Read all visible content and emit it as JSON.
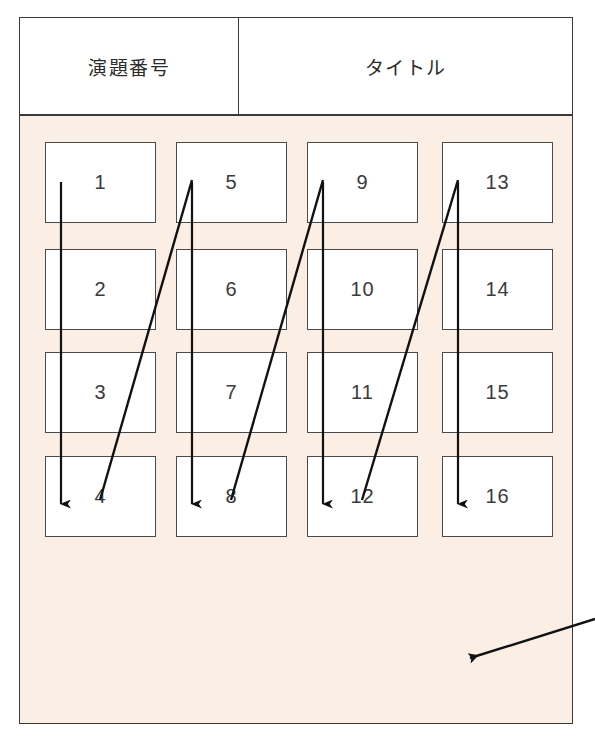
{
  "header": {
    "columns": [
      {
        "key": "number",
        "label": "演題番号"
      },
      {
        "key": "title",
        "label": "タイトル"
      }
    ]
  },
  "panel": {
    "background_color": "#faeee5",
    "border_color": "#3a3a3a"
  },
  "grid": {
    "rows": 4,
    "columns": 4,
    "order": "column-major",
    "cells": [
      {
        "label": "1",
        "col": 0,
        "row": 0,
        "x": 25,
        "y": 26
      },
      {
        "label": "2",
        "col": 0,
        "row": 1,
        "x": 25,
        "y": 133
      },
      {
        "label": "3",
        "col": 0,
        "row": 2,
        "x": 25,
        "y": 236
      },
      {
        "label": "4",
        "col": 0,
        "row": 3,
        "x": 25,
        "y": 340
      },
      {
        "label": "5",
        "col": 1,
        "row": 0,
        "x": 156,
        "y": 26
      },
      {
        "label": "6",
        "col": 1,
        "row": 1,
        "x": 156,
        "y": 133
      },
      {
        "label": "7",
        "col": 1,
        "row": 2,
        "x": 156,
        "y": 236
      },
      {
        "label": "8",
        "col": 1,
        "row": 3,
        "x": 156,
        "y": 340
      },
      {
        "label": "9",
        "col": 2,
        "row": 0,
        "x": 287,
        "y": 26
      },
      {
        "label": "10",
        "col": 2,
        "row": 1,
        "x": 287,
        "y": 133
      },
      {
        "label": "11",
        "col": 2,
        "row": 2,
        "x": 287,
        "y": 236
      },
      {
        "label": "12",
        "col": 2,
        "row": 3,
        "x": 287,
        "y": 340
      },
      {
        "label": "13",
        "col": 3,
        "row": 0,
        "x": 422,
        "y": 26
      },
      {
        "label": "14",
        "col": 3,
        "row": 1,
        "x": 422,
        "y": 133
      },
      {
        "label": "15",
        "col": 3,
        "row": 2,
        "x": 422,
        "y": 236
      },
      {
        "label": "16",
        "col": 3,
        "row": 3,
        "x": 422,
        "y": 340
      }
    ]
  },
  "annotations": {
    "flow_color": "#111111",
    "column_flow_arrows": [
      {
        "name": "column-1-flow",
        "x1": 61,
        "y1": 182,
        "x2": 61,
        "y2": 504
      },
      {
        "name": "column-2-flow",
        "x1": 192,
        "y1": 182,
        "x2": 192,
        "y2": 504
      },
      {
        "name": "column-3-flow",
        "x1": 323,
        "y1": 182,
        "x2": 323,
        "y2": 504
      },
      {
        "name": "column-4-flow",
        "x1": 458,
        "y1": 182,
        "x2": 458,
        "y2": 504
      }
    ],
    "column_return_lines": [
      {
        "name": "return-col1-to-col2",
        "x1": 100,
        "y1": 500,
        "x2": 192,
        "y2": 180
      },
      {
        "name": "return-col2-to-col3",
        "x1": 231,
        "y1": 500,
        "x2": 323,
        "y2": 180
      },
      {
        "name": "return-col3-to-col4",
        "x1": 362,
        "y1": 500,
        "x2": 458,
        "y2": 180
      }
    ],
    "pointer_arrow": {
      "name": "external-pointer-arrow",
      "x1": 595,
      "y1": 619,
      "x2": 470,
      "y2": 658
    }
  }
}
